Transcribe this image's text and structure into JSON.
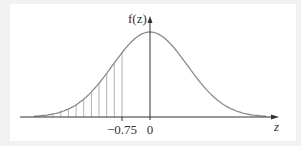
{
  "chart_data": {
    "type": "area",
    "title": "",
    "xlabel": "z",
    "ylabel": "f(z)",
    "x_ticks": [
      {
        "value": -0.75,
        "label": "−0.75"
      },
      {
        "value": 0,
        "label": "0"
      }
    ],
    "curve": "standard normal pdf",
    "shaded_region": {
      "from": "-inf",
      "to": -0.75,
      "style": "vertical-lines"
    },
    "xlim": [
      -3.3,
      3.3
    ],
    "grid": false,
    "legend": null
  },
  "labels": {
    "y_axis": "f(z)",
    "x_axis": "z",
    "tick_neg": "−0.75",
    "tick_zero": "0"
  },
  "colors": {
    "curve": "#8a8a8a",
    "axis": "#333333",
    "hatch": "#9a9a9a",
    "frame": "#f1f1f1",
    "panel": "#ffffff"
  }
}
